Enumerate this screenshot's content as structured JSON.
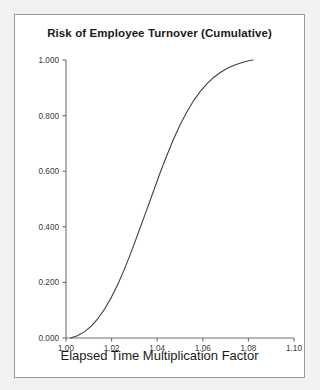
{
  "figure": {
    "title": "Risk of Employee Turnover (Cumulative)",
    "background_color": "#ffffff",
    "page_color": "#f2f2f2",
    "border_color": "#9a9a9a"
  },
  "chart_data": {
    "type": "line",
    "title": "Risk of Employee Turnover (Cumulative)",
    "xlabel": "Elapsed Time Multiplication Factor",
    "ylabel": "",
    "xlim": [
      1.0,
      1.1
    ],
    "ylim": [
      0.0,
      1.0
    ],
    "xticks": [
      1.0,
      1.02,
      1.04,
      1.06,
      1.08,
      1.1
    ],
    "xtick_labels": [
      "1.00",
      "1.02",
      "1.04",
      "1.06",
      "1.08",
      "1.10"
    ],
    "yticks": [
      0.0,
      0.2,
      0.4,
      0.6,
      0.8,
      1.0
    ],
    "ytick_labels": [
      "0.000",
      "0.200",
      "0.400",
      "0.600",
      "0.800",
      "1.000"
    ],
    "grid": false,
    "legend": false,
    "series": [
      {
        "name": "Cumulative risk of employee turnover",
        "color": "#404040",
        "line_width": 1.1,
        "x": [
          1.002,
          1.005,
          1.008,
          1.011,
          1.014,
          1.017,
          1.02,
          1.023,
          1.026,
          1.029,
          1.032,
          1.035,
          1.038,
          1.041,
          1.044,
          1.047,
          1.05,
          1.053,
          1.056,
          1.059,
          1.062,
          1.065,
          1.068,
          1.071,
          1.074,
          1.077,
          1.08,
          1.082
        ],
        "y": [
          0.0,
          0.008,
          0.022,
          0.042,
          0.07,
          0.105,
          0.148,
          0.198,
          0.255,
          0.318,
          0.385,
          0.452,
          0.52,
          0.588,
          0.652,
          0.712,
          0.766,
          0.813,
          0.854,
          0.888,
          0.916,
          0.939,
          0.957,
          0.971,
          0.982,
          0.99,
          0.997,
          1.0
        ]
      }
    ]
  },
  "axes": {
    "x_axis_name": "x-axis",
    "y_axis_name": "y-axis"
  }
}
